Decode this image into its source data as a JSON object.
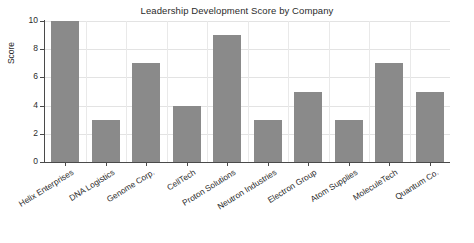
{
  "chart_data": {
    "type": "bar",
    "title": "Leadership Development Score by Company",
    "xlabel": "",
    "ylabel": "Score",
    "categories": [
      "Helix Enterprises",
      "DNA Logistics",
      "Genome Corp.",
      "CellTech",
      "Proton Solutions",
      "Neutron Industries",
      "Electron Group",
      "Atom Supplies",
      "MoleculeTech",
      "Quantum Co."
    ],
    "values": [
      10,
      3,
      7,
      4,
      9,
      3,
      5,
      3,
      7,
      5
    ],
    "ylim": [
      0,
      10
    ],
    "yticks": [
      0,
      2,
      4,
      6,
      8,
      10
    ],
    "ytick_labels": [
      "0",
      "2",
      "4",
      "6",
      "8",
      "10"
    ],
    "grid": true,
    "legend": false,
    "bar_color": "#8a8a8a",
    "background_color": "#ffffff",
    "axis_color": "#4a4a4a",
    "grid_color": "#e3e3e3",
    "text_color": "#2b2b2b"
  }
}
